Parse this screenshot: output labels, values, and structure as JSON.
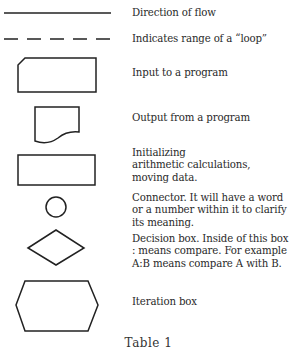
{
  "legend": {
    "items": [
      {
        "symbol": "solid-line",
        "lines": [
          "Direction of flow"
        ]
      },
      {
        "symbol": "dashed-line",
        "lines": [
          "Indicates range of a “loop”"
        ]
      },
      {
        "symbol": "input-shape",
        "lines": [
          "Input to a program"
        ]
      },
      {
        "symbol": "output-shape",
        "lines": [
          "Output from a program"
        ]
      },
      {
        "symbol": "process-rectangle",
        "lines": [
          "Initializing",
          "arithmetic calculations,",
          "moving data."
        ]
      },
      {
        "symbol": "connector-circle",
        "lines": [
          "Connector. It will have a word",
          "or a number within it to clarify",
          "its meaning."
        ]
      },
      {
        "symbol": "decision-diamond",
        "lines": [
          "Decision box. Inside of this box",
          ": means compare. For example",
          "A:B means compare A with B."
        ]
      },
      {
        "symbol": "iteration-hexagon",
        "lines": [
          "Iteration box"
        ]
      }
    ]
  },
  "caption": "Table 1",
  "colors": {
    "stroke": "#222222",
    "text": "#2a2a2a",
    "background": "#ffffff"
  }
}
